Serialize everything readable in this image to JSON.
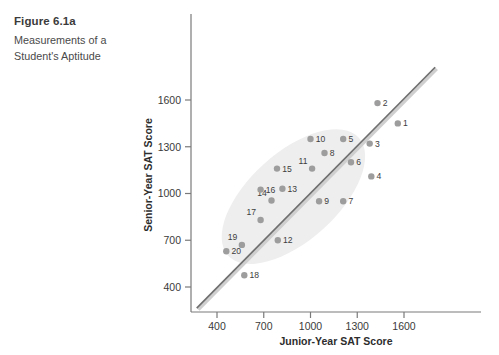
{
  "caption": {
    "title": "Figure 6.1a",
    "subtitle": "Measurements of a Student's Aptitude"
  },
  "colors": {
    "dot": "#9d9d9d",
    "line": "#8d8d8d",
    "line_dark": "#6f6f6f",
    "ellipse": "#eeeeee",
    "axis": "#7a7a7a",
    "text": "#3a3a3a",
    "background": "#ffffff"
  },
  "chart_data": {
    "type": "scatter",
    "title": "Measurements of a Student's Aptitude",
    "xlabel": "Junior-Year SAT Score",
    "ylabel": "Senior-Year SAT Score",
    "xticks": [
      400,
      700,
      1000,
      1300,
      1600
    ],
    "yticks": [
      400,
      700,
      1000,
      1300,
      1600
    ],
    "xlim": [
      250,
      1800
    ],
    "ylim": [
      250,
      1800
    ],
    "grid": false,
    "legend": null,
    "reference_line": {
      "label": "identity / regression line",
      "x": [
        270,
        1800
      ],
      "y": [
        265,
        1810
      ]
    },
    "ellipse_overlay": {
      "label": "concentration ellipse",
      "center_x": 890,
      "center_y": 980,
      "angle_deg": -42
    },
    "points": [
      {
        "label": "1",
        "x": 1560,
        "y": 1450
      },
      {
        "label": "2",
        "x": 1430,
        "y": 1580
      },
      {
        "label": "3",
        "x": 1380,
        "y": 1320
      },
      {
        "label": "4",
        "x": 1390,
        "y": 1110
      },
      {
        "label": "5",
        "x": 1210,
        "y": 1350
      },
      {
        "label": "6",
        "x": 1260,
        "y": 1200
      },
      {
        "label": "7",
        "x": 1210,
        "y": 950
      },
      {
        "label": "8",
        "x": 1090,
        "y": 1260
      },
      {
        "label": "9",
        "x": 1055,
        "y": 950
      },
      {
        "label": "10",
        "x": 1000,
        "y": 1350
      },
      {
        "label": "11",
        "x": 1010,
        "y": 1160
      },
      {
        "label": "12",
        "x": 790,
        "y": 700
      },
      {
        "label": "13",
        "x": 820,
        "y": 1030
      },
      {
        "label": "14",
        "x": 750,
        "y": 955
      },
      {
        "label": "15",
        "x": 785,
        "y": 1160
      },
      {
        "label": "16",
        "x": 680,
        "y": 1025
      },
      {
        "label": "17",
        "x": 680,
        "y": 830
      },
      {
        "label": "18",
        "x": 575,
        "y": 475
      },
      {
        "label": "19",
        "x": 560,
        "y": 670
      },
      {
        "label": "20",
        "x": 460,
        "y": 630
      }
    ]
  }
}
